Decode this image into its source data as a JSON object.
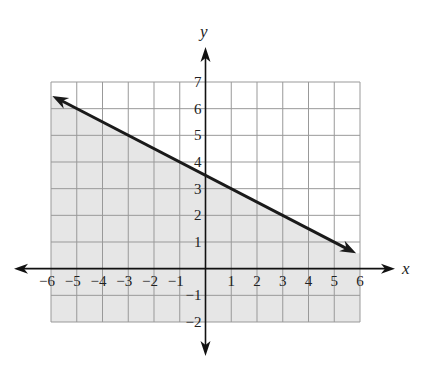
{
  "chart_data": {
    "type": "line",
    "title": "",
    "xlabel": "x",
    "ylabel": "y",
    "xlim": [
      -6,
      6
    ],
    "ylim": [
      -2,
      7
    ],
    "grid": true,
    "x_ticks": [
      -6,
      -5,
      -4,
      -3,
      -2,
      -1,
      1,
      2,
      3,
      4,
      5,
      6
    ],
    "y_ticks": [
      7,
      6,
      5,
      4,
      3,
      2,
      1,
      -1,
      -2
    ],
    "x_tick_labels": [
      "−6",
      "−5",
      "−4",
      "−3",
      "−2",
      "−1",
      "1",
      "2",
      "3",
      "4",
      "5",
      "6"
    ],
    "y_tick_labels": [
      "7",
      "6",
      "5",
      "4",
      "3",
      "2",
      "1",
      "−1",
      "−2"
    ],
    "series": [
      {
        "name": "boundary line",
        "style": "solid",
        "arrows": "both",
        "equation": "y = -0.5x + 3.5",
        "slope": -0.5,
        "intercept": 3.5,
        "x": [
          -5.9,
          0,
          5.8
        ],
        "y": [
          6.45,
          3.5,
          0.6
        ]
      }
    ],
    "shaded_region": {
      "side": "below",
      "inequality": "y <= -0.5x + 3.5",
      "color": "#e6e6e6"
    },
    "colors": {
      "grid": "#999999",
      "line": "#1a1a1a",
      "shade": "#e6e6e6",
      "axes": "#111111"
    }
  }
}
